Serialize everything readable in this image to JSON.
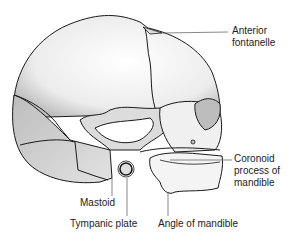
{
  "figure": {
    "labels": [
      {
        "id": "anterior-fontanelle",
        "lines": [
          "Anterior",
          "fontanelle"
        ]
      },
      {
        "id": "coronoid-process",
        "lines": [
          "Coronoid",
          "process of",
          "mandible"
        ]
      },
      {
        "id": "mastoid",
        "lines": [
          "Mastoid"
        ]
      },
      {
        "id": "tympanic-plate",
        "lines": [
          "Tympanic plate"
        ]
      },
      {
        "id": "angle-of-mandible",
        "lines": [
          "Angle of mandible"
        ]
      }
    ]
  },
  "colors": {
    "outline": "#1a1a1a",
    "bone_light": "#f2f2f2",
    "bone_shade": "#c8c8c8",
    "bone_dark": "#a8a8a8",
    "leader": "#555555",
    "text": "#222222"
  }
}
